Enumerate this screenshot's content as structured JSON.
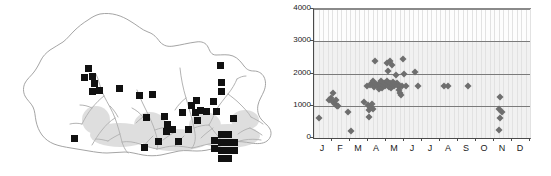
{
  "figure": {
    "panels": [
      "distribution-map",
      "elevation-by-month-scatter"
    ]
  },
  "map": {
    "region_name": "Bhutan",
    "outline_color": "#8c8c8c",
    "river_color": "#9a9a9a",
    "record_marker_color": "#111111",
    "record_marker_shape": "square",
    "record_count": 57,
    "records": [
      {
        "x": 88,
        "y": 68
      },
      {
        "x": 84,
        "y": 77
      },
      {
        "x": 92,
        "y": 76
      },
      {
        "x": 94,
        "y": 83
      },
      {
        "x": 92,
        "y": 91
      },
      {
        "x": 99,
        "y": 90
      },
      {
        "x": 119,
        "y": 88
      },
      {
        "x": 139,
        "y": 95
      },
      {
        "x": 152,
        "y": 94
      },
      {
        "x": 74,
        "y": 138
      },
      {
        "x": 146,
        "y": 117
      },
      {
        "x": 164,
        "y": 116
      },
      {
        "x": 167,
        "y": 124
      },
      {
        "x": 166,
        "y": 131
      },
      {
        "x": 144,
        "y": 147
      },
      {
        "x": 182,
        "y": 112
      },
      {
        "x": 191,
        "y": 105
      },
      {
        "x": 195,
        "y": 112
      },
      {
        "x": 197,
        "y": 120
      },
      {
        "x": 200,
        "y": 110
      },
      {
        "x": 206,
        "y": 111
      },
      {
        "x": 196,
        "y": 100
      },
      {
        "x": 213,
        "y": 101
      },
      {
        "x": 216,
        "y": 111
      },
      {
        "x": 220,
        "y": 65
      },
      {
        "x": 221,
        "y": 82
      },
      {
        "x": 221,
        "y": 91
      },
      {
        "x": 233,
        "y": 118
      },
      {
        "x": 221,
        "y": 134
      },
      {
        "x": 228,
        "y": 134
      },
      {
        "x": 221,
        "y": 142
      },
      {
        "x": 228,
        "y": 142
      },
      {
        "x": 221,
        "y": 150
      },
      {
        "x": 228,
        "y": 150
      },
      {
        "x": 221,
        "y": 158
      },
      {
        "x": 228,
        "y": 158
      },
      {
        "x": 214,
        "y": 140
      },
      {
        "x": 214,
        "y": 148
      },
      {
        "x": 234,
        "y": 142
      },
      {
        "x": 234,
        "y": 150
      },
      {
        "x": 158,
        "y": 141
      },
      {
        "x": 172,
        "y": 129
      },
      {
        "x": 188,
        "y": 129
      },
      {
        "x": 178,
        "y": 141
      }
    ]
  },
  "chart_data": {
    "type": "scatter",
    "title": "",
    "xlabel": "",
    "ylabel": "",
    "xlim": [
      0,
      12
    ],
    "ylim": [
      0,
      4000
    ],
    "yticks": [
      0,
      1000,
      2000,
      3000,
      4000
    ],
    "ytick_labels": [
      "0",
      "1000",
      "2000",
      "3000",
      "4000"
    ],
    "xtick_labels": [
      "J",
      "F",
      "M",
      "A",
      "M",
      "J",
      "J",
      "A",
      "S",
      "O",
      "N",
      "D"
    ],
    "xtick_names": [
      "January",
      "February",
      "March",
      "April",
      "May",
      "June",
      "July",
      "August",
      "September",
      "October",
      "November",
      "December"
    ],
    "grid": "horizontal",
    "legend": "none",
    "marker": "diamond",
    "marker_color": "#6e6e6e",
    "series": [
      {
        "name": "elevation-records",
        "points": [
          [
            0.25,
            620
          ],
          [
            0.85,
            1180
          ],
          [
            0.95,
            1230
          ],
          [
            1.05,
            1120
          ],
          [
            1.05,
            1390
          ],
          [
            1.15,
            1060
          ],
          [
            1.2,
            1170
          ],
          [
            1.3,
            980
          ],
          [
            1.35,
            1000
          ],
          [
            1.9,
            800
          ],
          [
            2.05,
            220
          ],
          [
            2.8,
            1110
          ],
          [
            3.0,
            1010
          ],
          [
            3.05,
            880
          ],
          [
            3.1,
            960
          ],
          [
            3.2,
            1050
          ],
          [
            3.25,
            900
          ],
          [
            3.05,
            660
          ],
          [
            2.95,
            1620
          ],
          [
            3.1,
            1640
          ],
          [
            3.2,
            1700
          ],
          [
            3.3,
            1760
          ],
          [
            3.35,
            1590
          ],
          [
            3.45,
            1680
          ],
          [
            3.4,
            2400
          ],
          [
            3.55,
            1600
          ],
          [
            3.6,
            1520
          ],
          [
            3.65,
            1700
          ],
          [
            3.7,
            1760
          ],
          [
            3.75,
            1620
          ],
          [
            3.8,
            1560
          ],
          [
            3.85,
            1640
          ],
          [
            3.9,
            1720
          ],
          [
            3.95,
            1600
          ],
          [
            4.0,
            1680
          ],
          [
            4.05,
            1760
          ],
          [
            4.1,
            1640
          ],
          [
            4.15,
            1580
          ],
          [
            4.2,
            1700
          ],
          [
            4.25,
            1620
          ],
          [
            4.3,
            1540
          ],
          [
            4.35,
            1660
          ],
          [
            4.4,
            1740
          ],
          [
            4.45,
            1600
          ],
          [
            4.5,
            1680
          ],
          [
            4.05,
            2330
          ],
          [
            4.2,
            2400
          ],
          [
            4.35,
            2270
          ],
          [
            4.1,
            2080
          ],
          [
            4.55,
            1960
          ],
          [
            4.6,
            1700
          ],
          [
            4.65,
            1600
          ],
          [
            4.7,
            1500
          ],
          [
            4.75,
            1620
          ],
          [
            4.8,
            1390
          ],
          [
            4.85,
            1320
          ],
          [
            4.9,
            1600
          ],
          [
            4.95,
            2450
          ],
          [
            5.0,
            1980
          ],
          [
            5.1,
            1600
          ],
          [
            5.6,
            2050
          ],
          [
            5.75,
            1600
          ],
          [
            7.2,
            1600
          ],
          [
            7.45,
            1600
          ],
          [
            8.55,
            1600
          ],
          [
            10.35,
            1280
          ],
          [
            10.25,
            900
          ],
          [
            10.45,
            800
          ],
          [
            10.35,
            620
          ],
          [
            10.3,
            260
          ]
        ]
      }
    ]
  }
}
